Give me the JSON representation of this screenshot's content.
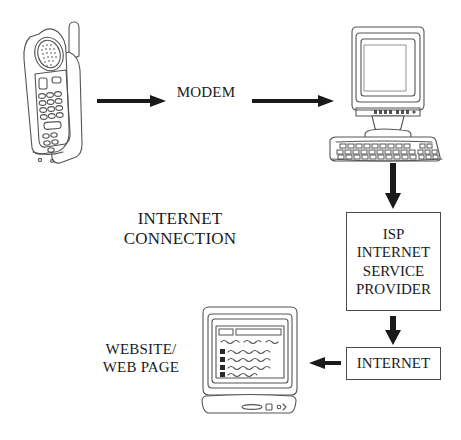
{
  "diagram": {
    "background_color": "#ffffff",
    "ink_color": "#1a1a1a",
    "line_color": "#4a4a4a",
    "arrow_color": "#1a1a1a"
  },
  "labels": {
    "modem": "MODEM",
    "internet_connection": "INTERNET\nCONNECTION",
    "website": "WEBSITE/\nWEB PAGE"
  },
  "boxes": {
    "isp": {
      "text": "ISP\nINTERNET\nSERVICE\nPROVIDER",
      "lines": [
        "ISP",
        "INTERNET",
        "SERVICE",
        "PROVIDER"
      ]
    },
    "internet": {
      "text": "INTERNET",
      "lines": [
        "INTERNET"
      ]
    }
  },
  "nodes": {
    "phone": {
      "name": "cordless-telephone-handset"
    },
    "computer": {
      "name": "desktop-computer-with-crt-monitor-and-keyboard"
    },
    "webpage_monitor": {
      "name": "crt-monitor-showing-web-page"
    }
  },
  "arrows": [
    {
      "name": "arrow-phone-to-modem",
      "direction": "right",
      "from": "phone",
      "to": "modem"
    },
    {
      "name": "arrow-modem-to-computer",
      "direction": "right",
      "from": "modem",
      "to": "computer"
    },
    {
      "name": "arrow-computer-to-isp",
      "direction": "down",
      "from": "computer",
      "to": "isp"
    },
    {
      "name": "arrow-isp-to-internet",
      "direction": "down",
      "from": "isp",
      "to": "internet"
    },
    {
      "name": "arrow-internet-to-webpage",
      "direction": "left",
      "from": "internet",
      "to": "webpage_monitor"
    }
  ]
}
